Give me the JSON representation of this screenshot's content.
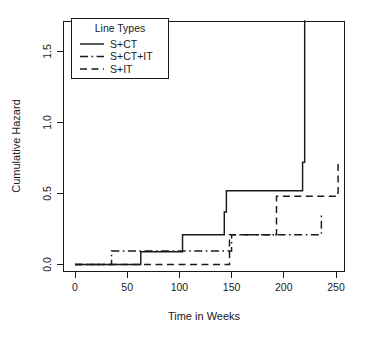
{
  "chart_data": {
    "type": "line",
    "title": "",
    "xlabel": "Time in Weeks",
    "ylabel": "Cumulative Hazard",
    "xlim": [
      -12,
      262
    ],
    "ylim": [
      -0.06,
      1.8
    ],
    "xticks": [
      0,
      50,
      100,
      150,
      200,
      250
    ],
    "xticklabels": [
      "0",
      "50",
      "100",
      "150",
      "200",
      "250"
    ],
    "yticks": [
      0.0,
      0.5,
      1.0,
      1.5
    ],
    "yticklabels": [
      "0.0",
      "0.5",
      "1.0",
      "1.5"
    ],
    "grid": false,
    "step_style": "post",
    "legend": {
      "title": "Line Types",
      "position": "top-left",
      "entries": [
        {
          "label": "S+CT",
          "dash": "solid"
        },
        {
          "label": "S+CT+IT",
          "dash": "dashdot"
        },
        {
          "label": "S+IT",
          "dash": "dashed"
        }
      ]
    },
    "series": [
      {
        "name": "S+CT",
        "dash": "solid",
        "x": [
          0,
          55,
          63,
          103,
          130,
          143,
          145,
          218,
          218,
          220
        ],
        "y": [
          0.0,
          0.0,
          0.09,
          0.21,
          0.21,
          0.37,
          0.52,
          0.72,
          0.72,
          1.72
        ]
      },
      {
        "name": "S+CT+IT",
        "dash": "dashdot",
        "x": [
          0,
          35,
          73,
          150,
          157,
          236
        ],
        "y": [
          0.0,
          0.095,
          0.095,
          0.21,
          0.21,
          0.35
        ]
      },
      {
        "name": "S+IT",
        "dash": "dashed",
        "x": [
          0,
          102,
          148,
          193,
          252
        ],
        "y": [
          0.0,
          0.0,
          0.21,
          0.48,
          0.72
        ]
      }
    ],
    "annotations": [
      {
        "text": "S+CT jumps sharply at ~week 218 to 1.72",
        "series": "S+CT"
      },
      {
        "text": "S+IT plateaus at 0.72 after ~week 193",
        "series": "S+IT"
      },
      {
        "text": "S+CT+IT plateaus at 0.35 after ~week 157",
        "series": "S+CT+IT"
      }
    ]
  },
  "colors": {
    "ink": "#1a1a1a",
    "background": "#ffffff"
  }
}
